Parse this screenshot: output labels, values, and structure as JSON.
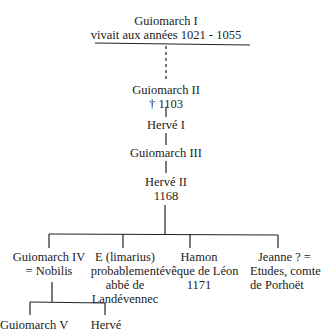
{
  "nodes": {
    "g1": {
      "name": "Guiomarch I",
      "note": "vivait aux années 1021 - 1055"
    },
    "g2": {
      "name": "Guiomarch II",
      "note": "† 1103"
    },
    "h1": {
      "name": "Hervé I"
    },
    "g3": {
      "name": "Guiomarch III"
    },
    "h2": {
      "name": "Hervé II",
      "note": "1168"
    },
    "g4": {
      "name": "Guiomarch IV",
      "note": "= Nobilis"
    },
    "e": {
      "name": "E (limarius)",
      "line2": "probablement",
      "line3": "abbé de",
      "line4": "Landévennec"
    },
    "hamon": {
      "name": "Hamon",
      "line2": "évêque de Léon",
      "line3": "1171"
    },
    "jeanne": {
      "name": "Jeanne ? =",
      "line2": "Etudes, comte",
      "line3": "de Porhoët"
    },
    "g5": {
      "name": "Guiomarch V"
    },
    "herve": {
      "name": "Hervé"
    }
  },
  "colors": {
    "ink": "#222222",
    "background": "#ffffff"
  }
}
